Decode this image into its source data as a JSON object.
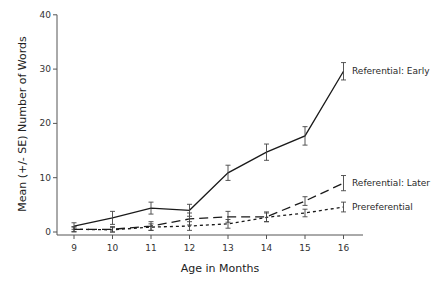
{
  "chart_data": {
    "type": "line",
    "title": "",
    "xlabel": "Age in Months",
    "ylabel": "Mean (+/- SE) Number of Words",
    "x": [
      9,
      10,
      11,
      12,
      13,
      14,
      15,
      16
    ],
    "ylim": [
      0,
      40
    ],
    "yticks": [
      0,
      10,
      20,
      30,
      40
    ],
    "grid": false,
    "legend": "inline labels at right end of each line",
    "series": [
      {
        "name": "Referential: Early",
        "style": "solid",
        "values": [
          1.1,
          2.6,
          4.4,
          4.0,
          10.9,
          14.7,
          17.7,
          29.6
        ],
        "se": [
          0.6,
          1.2,
          1.1,
          1.1,
          1.4,
          1.5,
          1.7,
          1.6
        ]
      },
      {
        "name": "Referential: Later",
        "style": "dashed",
        "values": [
          0.5,
          0.5,
          1.1,
          2.4,
          2.8,
          2.8,
          5.7,
          9.0
        ],
        "se": [
          0.5,
          0.5,
          0.8,
          1.1,
          1.0,
          0.9,
          0.8,
          1.4
        ]
      },
      {
        "name": "Prereferential",
        "style": "dotted",
        "values": [
          0.5,
          0.4,
          0.9,
          1.1,
          1.5,
          2.7,
          3.5,
          4.6
        ],
        "se": [
          0.4,
          0.4,
          0.6,
          0.8,
          0.8,
          0.8,
          0.7,
          0.9
        ]
      }
    ]
  },
  "colors": {
    "line": "#1a1a1a",
    "axis": "#555555",
    "background": "#ffffff"
  }
}
